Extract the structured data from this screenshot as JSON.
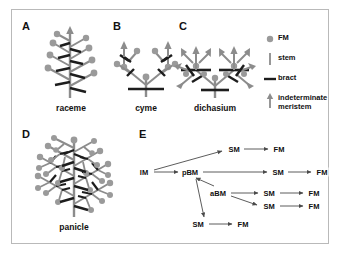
{
  "figure": {
    "panels": [
      {
        "letter": "A",
        "caption": "raceme"
      },
      {
        "letter": "B",
        "caption": "cyme"
      },
      {
        "letter": "C",
        "caption": "dichasium"
      },
      {
        "letter": "D",
        "caption": "panicle"
      },
      {
        "letter": "E",
        "caption": ""
      }
    ]
  },
  "legend": {
    "items": [
      {
        "glyph": "circle",
        "label": "FM"
      },
      {
        "glyph": "vertical-line",
        "label": "stem"
      },
      {
        "glyph": "horizontal-line",
        "label": "bract"
      },
      {
        "glyph": "arrow",
        "label": "indeterminate meristem"
      }
    ]
  },
  "flowchart": {
    "nodes": [
      {
        "id": "im",
        "label": "IM",
        "x": 8,
        "y": 38
      },
      {
        "id": "pbm",
        "label": "pBM",
        "x": 54,
        "y": 38
      },
      {
        "id": "sm1",
        "label": "SM",
        "x": 98,
        "y": 15
      },
      {
        "id": "fm1",
        "label": "FM",
        "x": 143,
        "y": 15
      },
      {
        "id": "sm2",
        "label": "SM",
        "x": 142,
        "y": 38
      },
      {
        "id": "fm2",
        "label": "FM",
        "x": 186,
        "y": 38
      },
      {
        "id": "abm",
        "label": "aBM",
        "x": 82,
        "y": 59
      },
      {
        "id": "sm3",
        "label": "SM",
        "x": 133,
        "y": 59
      },
      {
        "id": "fm3",
        "label": "FM",
        "x": 178,
        "y": 59
      },
      {
        "id": "sm4",
        "label": "SM",
        "x": 133,
        "y": 72
      },
      {
        "id": "fm4",
        "label": "FM",
        "x": 178,
        "y": 72
      },
      {
        "id": "sm5",
        "label": "SM",
        "x": 62,
        "y": 90
      },
      {
        "id": "fm5",
        "label": "FM",
        "x": 107,
        "y": 90
      }
    ],
    "edges": [
      {
        "from": "im",
        "to": "pbm"
      },
      {
        "from": "im",
        "to": "sm1"
      },
      {
        "from": "sm1",
        "to": "fm1"
      },
      {
        "from": "pbm",
        "to": "sm2"
      },
      {
        "from": "sm2",
        "to": "fm2"
      },
      {
        "from": "abm",
        "to": "pbm"
      },
      {
        "from": "pbm",
        "to": "sm5"
      },
      {
        "from": "abm",
        "to": "sm3"
      },
      {
        "from": "sm3",
        "to": "fm3"
      },
      {
        "from": "abm",
        "to": "sm4"
      },
      {
        "from": "sm4",
        "to": "fm4"
      },
      {
        "from": "sm5",
        "to": "fm5"
      }
    ]
  },
  "colors": {
    "fm": "#9a9a9a",
    "branch": "#8c8c8c",
    "bract": "#1d1d1d",
    "text": "#111111",
    "border": "#b9b9b9",
    "background": "#ffffff"
  }
}
